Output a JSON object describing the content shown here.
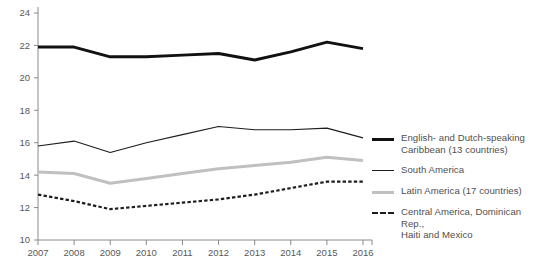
{
  "chart_data": {
    "type": "line",
    "title": "",
    "xlabel": "",
    "ylabel": "",
    "x": [
      2007,
      2008,
      2009,
      2010,
      2011,
      2012,
      2013,
      2014,
      2015,
      2016
    ],
    "categories": [
      "2007",
      "2008",
      "2009",
      "2010",
      "2011",
      "2012",
      "2013",
      "2014",
      "2015",
      "2016"
    ],
    "ylim": [
      10,
      24
    ],
    "yticks": [
      10,
      12,
      14,
      16,
      18,
      20,
      22,
      24
    ],
    "ytick_labels": [
      "10",
      "12",
      "14",
      "16",
      "18",
      "20",
      "22",
      "24"
    ],
    "grid": false,
    "legend_position": "right",
    "series": [
      {
        "name": "English- and Dutch-speaking Caribbean (13 countries)",
        "style": "thick-solid-black",
        "color": "#111111",
        "values": [
          21.9,
          21.9,
          21.3,
          21.3,
          21.4,
          21.5,
          21.1,
          21.6,
          22.2,
          21.8
        ]
      },
      {
        "name": "South America",
        "style": "thin-solid-black",
        "color": "#1d1d1d",
        "values": [
          15.8,
          16.1,
          15.4,
          16.0,
          16.5,
          17.0,
          16.8,
          16.8,
          16.9,
          16.3
        ]
      },
      {
        "name": "Latin America (17 countries)",
        "style": "thick-solid-gray",
        "color": "#c0c0c2",
        "values": [
          14.2,
          14.1,
          13.5,
          13.8,
          14.1,
          14.4,
          14.6,
          14.8,
          15.1,
          14.9
        ]
      },
      {
        "name": "Central America, Dominican Rep., Haiti and Mexico",
        "style": "dashed-black",
        "color": "#1d1d1d",
        "values": [
          12.8,
          12.4,
          11.9,
          12.1,
          12.3,
          12.5,
          12.8,
          13.2,
          13.6,
          13.6
        ]
      }
    ]
  },
  "legend": {
    "items": [
      {
        "label_line1": "English- and Dutch-speaking",
        "label_line2": "Caribbean (13 countries)"
      },
      {
        "label_line1": "South America",
        "label_line2": ""
      },
      {
        "label_line1": "Latin America (17 countries)",
        "label_line2": ""
      },
      {
        "label_line1": "Central America, Dominican Rep.,",
        "label_line2": "Haiti and Mexico"
      }
    ]
  }
}
